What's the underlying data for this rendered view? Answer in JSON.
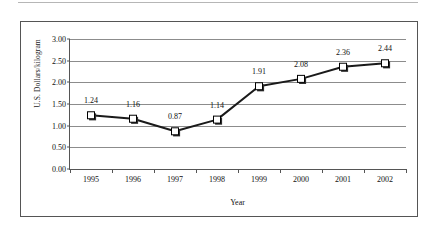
{
  "chart_data": {
    "type": "line",
    "title": "",
    "xlabel": "Year",
    "ylabel": "U.S. Dollars/kilogram",
    "categories": [
      "1995",
      "1996",
      "1997",
      "1998",
      "1999",
      "2000",
      "2001",
      "2002"
    ],
    "values": [
      1.24,
      1.16,
      0.87,
      1.14,
      1.91,
      2.08,
      2.36,
      2.44
    ],
    "data_labels": [
      "1.24",
      "1.16",
      "0.87",
      "1.14",
      "1.91",
      "2.08",
      "2.36",
      "2.44"
    ],
    "ylim": [
      0.0,
      3.0
    ],
    "yticks": [
      0.0,
      0.5,
      1.0,
      1.5,
      2.0,
      2.5,
      3.0
    ],
    "ytick_labels": [
      "0.00",
      "0.50",
      "1.00",
      "1.50",
      "2.00",
      "2.50",
      "3.00"
    ],
    "grid": true,
    "legend": false,
    "marker": "square",
    "series_color": "#1a1a1a",
    "marker_fill": "#ffffff",
    "marker_edge": "#000000",
    "gridline_color": "#8c8c8c",
    "axis_color": "#555555",
    "label_offsets": [
      -1,
      -1,
      1,
      -1,
      -1,
      -1,
      -1,
      -1
    ]
  }
}
